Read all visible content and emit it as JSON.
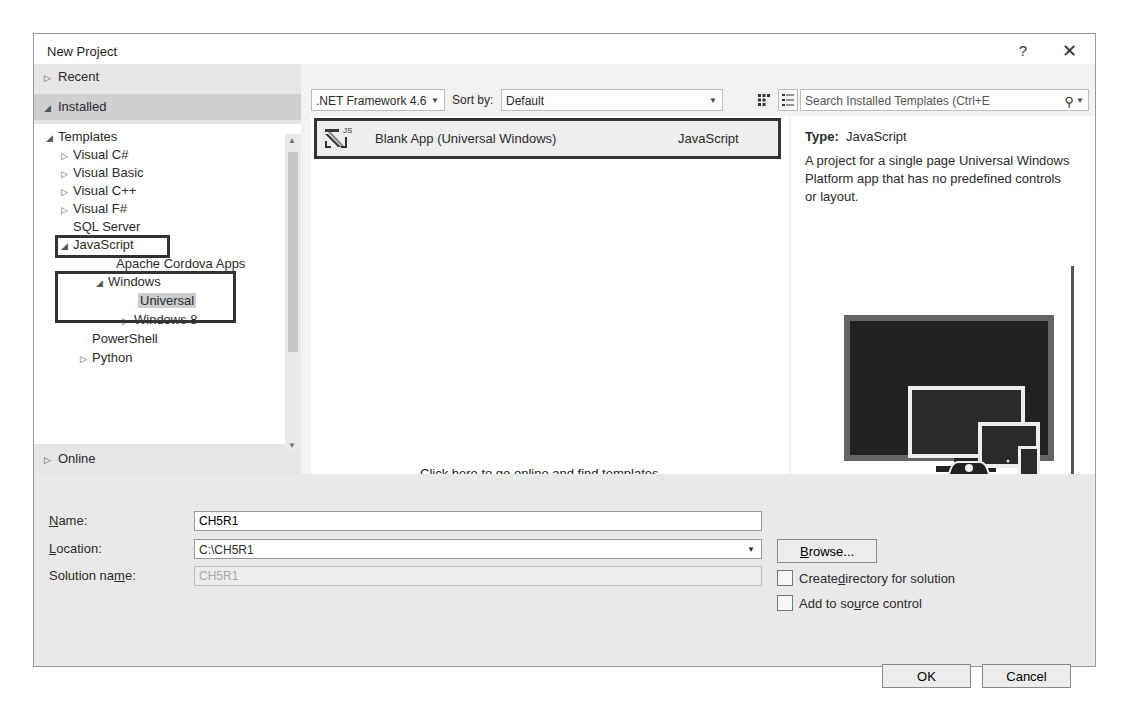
{
  "window": {
    "title": "New Project",
    "help_label": "?",
    "close_label": "✕"
  },
  "nav": {
    "recent": "Recent",
    "installed": "Installed",
    "online": "Online",
    "tree": [
      {
        "label": "Templates",
        "expander": "◢"
      },
      {
        "label": "Visual C#",
        "expander": "▷"
      },
      {
        "label": "Visual Basic",
        "expander": "▷"
      },
      {
        "label": "Visual C++",
        "expander": "▷"
      },
      {
        "label": "Visual F#",
        "expander": "▷"
      },
      {
        "label": "SQL Server",
        "expander": ""
      },
      {
        "label": "JavaScript",
        "expander": "◢"
      },
      {
        "label": "Apache Cordova Apps",
        "expander": ""
      },
      {
        "label": "Windows",
        "expander": "◢"
      },
      {
        "label": "Universal",
        "expander": ""
      },
      {
        "label": "Windows 8",
        "expander": "▷"
      },
      {
        "label": "PowerShell",
        "expander": ""
      },
      {
        "label": "Python",
        "expander": "▷"
      }
    ]
  },
  "toolbar": {
    "framework": ".NET Framework 4.6",
    "sort_label": "Sort by:",
    "sort_value": "Default",
    "search_placeholder": "Search Installed Templates (Ctrl+E)",
    "search_display": "Search Installed Templates (Ctrl+E"
  },
  "templates": [
    {
      "name": "Blank App (Universal Windows)",
      "language": "JavaScript",
      "icon_badge": "JS"
    }
  ],
  "online_link": "Click here to go online and find templates.",
  "details": {
    "type_label": "Type:",
    "type_value": "JavaScript",
    "description": "A project for a single page Universal Windows Platform app that has no predefined controls or layout."
  },
  "form": {
    "name_label_u": "N",
    "name_label_rest": "ame:",
    "name_value": "CH5R1",
    "location_label_u": "L",
    "location_label_rest": "ocation:",
    "location_value": "C:\\CH5R1",
    "solution_label_pre": "Solution na",
    "solution_label_u": "m",
    "solution_label_post": "e:",
    "solution_value": "CH5R1",
    "browse_u": "B",
    "browse_rest": "rowse...",
    "create_dir_pre": "Create ",
    "create_dir_u": "d",
    "create_dir_post": "irectory for solution",
    "source_pre": "Add to so",
    "source_u": "u",
    "source_post": "rce control",
    "ok": "OK",
    "cancel": "Cancel"
  }
}
